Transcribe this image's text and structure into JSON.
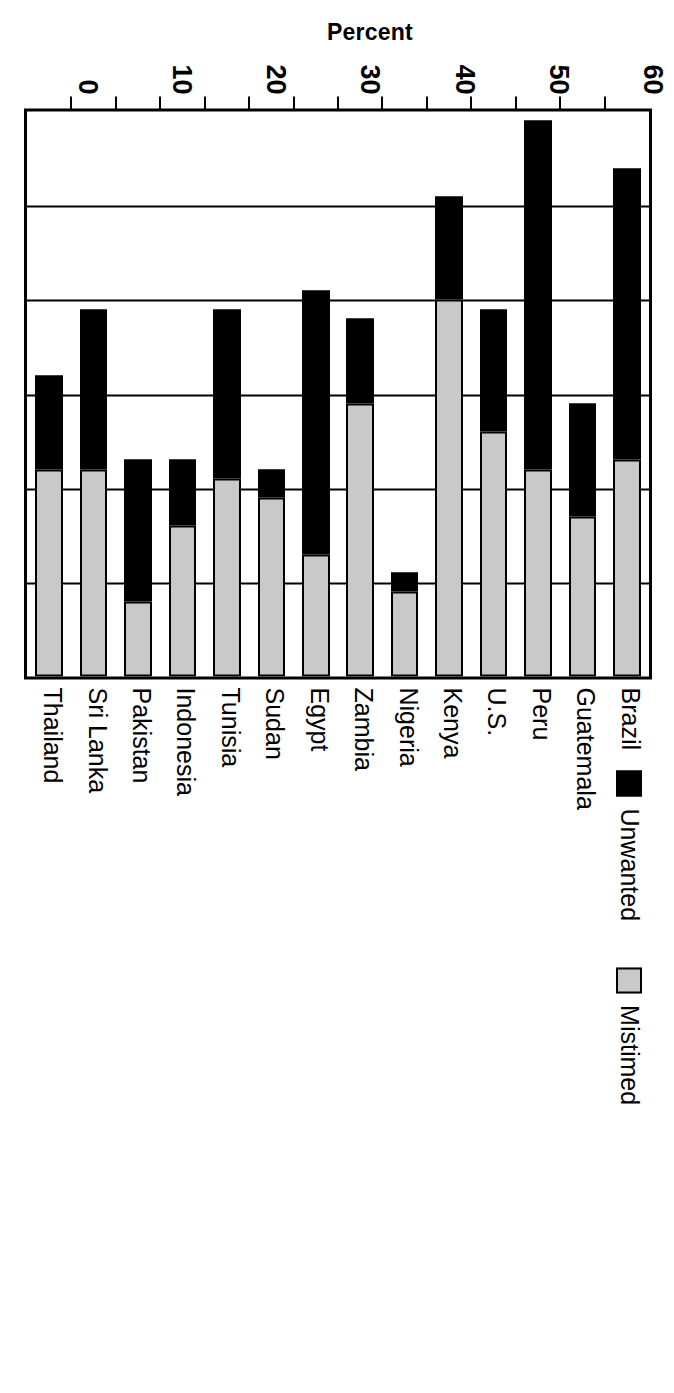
{
  "chart_data": {
    "type": "bar",
    "orientation": "vertical-stacked",
    "title": "",
    "xlabel": "",
    "ylabel": "Percent",
    "ylim": [
      0,
      60
    ],
    "yticks": [
      0,
      10,
      20,
      30,
      40,
      50,
      60
    ],
    "grid": true,
    "legend_position": "top-left",
    "categories": [
      "Brazil",
      "Guatemala",
      "Peru",
      "U.S.",
      "Kenya",
      "Nigeria",
      "Zambia",
      "Egypt",
      "Sudan",
      "Tunisia",
      "Indonesia",
      "Pakistan",
      "Sri Lanka",
      "Thailand"
    ],
    "series": [
      {
        "name": "Mistimed",
        "color": "#c9c9c9",
        "values": [
          23,
          17,
          22,
          26,
          40,
          9,
          29,
          13,
          19,
          21,
          16,
          8,
          22,
          22
        ]
      },
      {
        "name": "Unwanted",
        "color": "#000000",
        "values": [
          31,
          12,
          37,
          13,
          11,
          2,
          9,
          28,
          3,
          18,
          7,
          15,
          17,
          10
        ]
      }
    ],
    "totals": [
      54,
      29,
      59,
      39,
      51,
      11,
      38,
      41,
      22,
      39,
      23,
      23,
      39,
      32
    ]
  },
  "axis": {
    "y_title": "Percent",
    "tick_labels": [
      "60",
      "50",
      "40",
      "30",
      "20",
      "10",
      "0"
    ]
  },
  "legend": {
    "items": [
      {
        "label": "Unwanted",
        "swatch": "solid-black-swatch"
      },
      {
        "label": "Mistimed",
        "swatch": "solid-gray-swatch"
      }
    ]
  },
  "colors": {
    "unwanted": "#000000",
    "mistimed": "#c9c9c9",
    "axis": "#000000",
    "background": "#ffffff"
  }
}
